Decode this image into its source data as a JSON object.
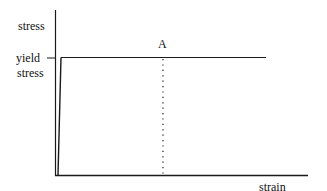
{
  "diagram": {
    "y_axis_label": "stress",
    "x_axis_label": "strain",
    "tick_label_line1": "yield",
    "tick_label_line2": "stress",
    "point_label": "A",
    "line_color": "#1a1a1a",
    "background": "#ffffff"
  }
}
